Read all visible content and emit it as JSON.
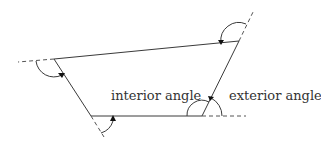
{
  "diagram": {
    "labels": {
      "interior": "interior angle",
      "exterior": "exterior angle"
    },
    "colors": {
      "line": "#3a3a3a",
      "dashed": "#555555",
      "text": "#333333",
      "background": "#ffffff"
    },
    "vertices": [
      {
        "name": "top-left",
        "x": 54,
        "y": 59
      },
      {
        "name": "top-right",
        "x": 239,
        "y": 41
      },
      {
        "name": "bottom-right",
        "x": 202,
        "y": 116
      },
      {
        "name": "bottom-left",
        "x": 91,
        "y": 116
      }
    ]
  }
}
